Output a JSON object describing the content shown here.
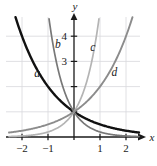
{
  "figure": {
    "title": "",
    "background_color": "#ffffff",
    "axis_color": "#1a1a1a",
    "grid_color": "#d8d8dc"
  },
  "axes": {
    "x_axis_label": "x",
    "y_axis_label": "y",
    "x_ticks": [
      {
        "value": -2,
        "label": "−2"
      },
      {
        "value": -1,
        "label": "−1"
      },
      {
        "value": 1,
        "label": "1"
      },
      {
        "value": 2,
        "label": "2"
      }
    ],
    "y_ticks": [
      {
        "value": 1,
        "label": ""
      },
      {
        "value": 2,
        "label": ""
      },
      {
        "value": 3,
        "label": "3"
      },
      {
        "value": 4,
        "label": "4"
      }
    ]
  },
  "curve_labels": [
    {
      "id": "a",
      "text": "a"
    },
    {
      "id": "b",
      "text": "b"
    },
    {
      "id": "c",
      "text": "c"
    },
    {
      "id": "d",
      "text": "d"
    }
  ],
  "chart_data": {
    "type": "line",
    "title": "",
    "xlabel": "x",
    "ylabel": "y",
    "xlim": [
      -2.55,
      2.55
    ],
    "ylim": [
      -0.2,
      4.8
    ],
    "grid": true,
    "legend": "inline-curve-labels",
    "x_ticks": [
      -2,
      -1,
      1,
      2
    ],
    "y_ticks": [
      1,
      2,
      3,
      4
    ],
    "y_tick_labels_shown": [
      3,
      4
    ],
    "series": [
      {
        "name": "a",
        "label": "a",
        "expression": "y = 2^(-x)",
        "color": "#111111",
        "width": 2.4,
        "x": [
          -2.5,
          -2.0,
          -1.5,
          -1.0,
          -0.5,
          0.0,
          0.5,
          1.0,
          1.5,
          2.0,
          2.5
        ],
        "values": [
          5.657,
          4.0,
          2.828,
          2.0,
          1.414,
          1.0,
          0.707,
          0.5,
          0.354,
          0.25,
          0.177
        ]
      },
      {
        "name": "b",
        "label": "b",
        "expression": "y = 5^(-x)",
        "color": "#787878",
        "width": 1.7,
        "x": [
          -1.1,
          -1.0,
          -0.75,
          -0.5,
          -0.25,
          0.0,
          0.25,
          0.5,
          1.0,
          1.5,
          2.0,
          2.5
        ],
        "values": [
          6.9,
          5.0,
          3.344,
          2.236,
          1.495,
          1.0,
          0.669,
          0.447,
          0.2,
          0.089,
          0.04,
          0.018
        ]
      },
      {
        "name": "c",
        "label": "c",
        "expression": "y = 5^x",
        "color": "#b4b4b4",
        "width": 1.7,
        "x": [
          -2.5,
          -2.0,
          -1.5,
          -1.0,
          -0.5,
          -0.25,
          0.0,
          0.25,
          0.5,
          0.75,
          1.0,
          1.1
        ],
        "values": [
          0.018,
          0.04,
          0.089,
          0.2,
          0.447,
          0.669,
          1.0,
          1.495,
          2.236,
          3.344,
          5.0,
          6.9
        ]
      },
      {
        "name": "d",
        "label": "d",
        "expression": "y = 2^x",
        "color": "#8c8c8c",
        "width": 1.9,
        "x": [
          -2.5,
          -2.0,
          -1.5,
          -1.0,
          -0.5,
          0.0,
          0.5,
          1.0,
          1.5,
          2.0,
          2.5
        ],
        "values": [
          0.177,
          0.25,
          0.354,
          0.5,
          0.707,
          1.0,
          1.414,
          2.0,
          2.828,
          4.0,
          5.657
        ]
      }
    ],
    "annotations": [
      {
        "text": "a",
        "x": -1.42,
        "y": 2.38
      },
      {
        "text": "b",
        "x": -0.62,
        "y": 3.55
      },
      {
        "text": "c",
        "x": 0.72,
        "y": 3.42
      },
      {
        "text": "d",
        "x": 1.55,
        "y": 2.42
      }
    ]
  }
}
